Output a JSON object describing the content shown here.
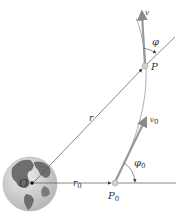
{
  "diagram": {
    "labels": {
      "origin": "O",
      "r": "r",
      "r0": "r",
      "r0_sub": "0",
      "P": "P",
      "P0": "P",
      "P0_sub": "0",
      "v": "v",
      "v0": "v",
      "v0_sub": "0",
      "phi": "φ",
      "phi0": "φ",
      "phi0_sub": "0"
    },
    "colors": {
      "line": "#555555",
      "vector": "#9a9a9a",
      "globe_land": "#6e6e6e",
      "globe_ocean": "#cfcfcf",
      "point": "#c8c8c8"
    }
  }
}
